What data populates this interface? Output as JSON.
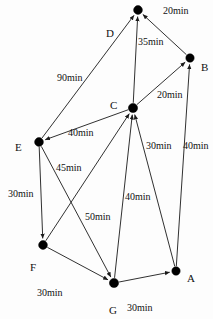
{
  "diagram": {
    "type": "node-link-diagram",
    "width": 213,
    "height": 319,
    "background_color": "#fdfdfd",
    "stroke_color": "#1a1a1a",
    "node_color": "#000000",
    "text_color": "#111111",
    "unit": "min"
  },
  "nodes": [
    {
      "id": "A",
      "label": "A",
      "x": 176,
      "y": 271,
      "r": 4.2,
      "label_x": 187,
      "label_y": 273
    },
    {
      "id": "B",
      "label": "B",
      "x": 190,
      "y": 58,
      "r": 4.2,
      "label_x": 201,
      "label_y": 62
    },
    {
      "id": "C",
      "label": "C",
      "x": 133,
      "y": 108,
      "r": 4.6,
      "label_x": 110,
      "label_y": 100
    },
    {
      "id": "D",
      "label": "D",
      "x": 138,
      "y": 10,
      "r": 4.4,
      "label_x": 106,
      "label_y": 28
    },
    {
      "id": "E",
      "label": "E",
      "x": 39,
      "y": 142,
      "r": 4.4,
      "label_x": 15,
      "label_y": 142
    },
    {
      "id": "F",
      "label": "F",
      "x": 43,
      "y": 245,
      "r": 4.4,
      "label_x": 30,
      "label_y": 262
    },
    {
      "id": "G",
      "label": "G",
      "x": 114,
      "y": 283,
      "r": 4.6,
      "label_x": 109,
      "label_y": 305
    }
  ],
  "edges": [
    {
      "id": "e-b-d",
      "from": "B",
      "to": "D",
      "weight": "20min",
      "label_x": 163,
      "label_y": 6
    },
    {
      "id": "e-c-d",
      "from": "C",
      "to": "D",
      "weight": "35min",
      "label_x": 138,
      "label_y": 37
    },
    {
      "id": "e-e-d",
      "from": "E",
      "to": "D",
      "weight": "90min",
      "label_x": 57,
      "label_y": 73
    },
    {
      "id": "e-c-b",
      "from": "C",
      "to": "B",
      "weight": "20min",
      "label_x": 157,
      "label_y": 90
    },
    {
      "id": "e-c-e",
      "from": "C",
      "to": "E",
      "weight": "40min",
      "label_x": 68,
      "label_y": 128
    },
    {
      "id": "e-a-c",
      "from": "A",
      "to": "C",
      "weight": "30min",
      "label_x": 146,
      "label_y": 141
    },
    {
      "id": "e-a-b",
      "from": "A",
      "to": "B",
      "weight": "40min",
      "label_x": 183,
      "label_y": 141
    },
    {
      "id": "e-e-f",
      "from": "E",
      "to": "F",
      "weight": "30min",
      "label_x": 8,
      "label_y": 189
    },
    {
      "id": "e-e-g",
      "from": "E",
      "to": "G",
      "weight": "45min",
      "label_x": 56,
      "label_y": 163
    },
    {
      "id": "e-f-c",
      "from": "F",
      "to": "C",
      "weight": "50min",
      "label_x": 85,
      "label_y": 212
    },
    {
      "id": "e-g-c",
      "from": "G",
      "to": "C",
      "weight": "40min",
      "label_x": 125,
      "label_y": 192
    },
    {
      "id": "e-f-g",
      "from": "F",
      "to": "G",
      "weight": "30min",
      "label_x": 37,
      "label_y": 288
    },
    {
      "id": "e-g-a",
      "from": "G",
      "to": "A",
      "weight": "30min",
      "label_x": 127,
      "label_y": 303
    }
  ]
}
